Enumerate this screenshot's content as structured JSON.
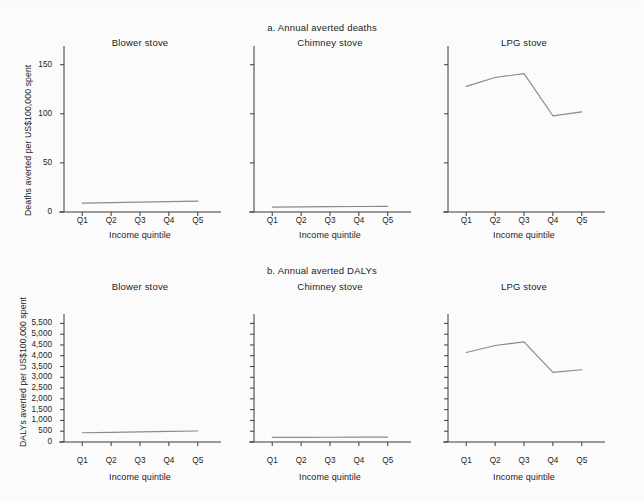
{
  "figure": {
    "background_color": "#fbfbfb",
    "line_color": "#8a8a8a",
    "axis_color": "#3a3a3a",
    "text_color": "#1c1c1c"
  },
  "sections": [
    {
      "key": "a",
      "title": "a. Annual averted deaths",
      "ylabel": "Deaths averted per US$100,000 spent",
      "xlabel": "Income quintile",
      "yticks": [
        "0",
        "50",
        "100",
        "150"
      ],
      "ytick_values": [
        0,
        50,
        100,
        150
      ],
      "ylim": [
        0,
        165
      ],
      "xticks": [
        "Q1",
        "Q2",
        "Q3",
        "Q4",
        "Q5"
      ],
      "panels": [
        {
          "title": "Blower stove",
          "values": [
            9,
            9.5,
            10,
            10.5,
            11
          ]
        },
        {
          "title": "Chimney stove",
          "values": [
            5,
            5.2,
            5.4,
            5.6,
            5.8
          ]
        },
        {
          "title": "LPG stove",
          "values": [
            128,
            137,
            141,
            98,
            102
          ]
        }
      ]
    },
    {
      "key": "b",
      "title": "b. Annual averted DALYs",
      "ylabel": "DALYs averted per US$100,000 spent",
      "xlabel": "Income quintile",
      "yticks": [
        "0",
        "500",
        "1,000",
        "1,500",
        "2,000",
        "2,500",
        "3,000",
        "3,500",
        "4,000",
        "4,500",
        "5,000",
        "5,500"
      ],
      "ytick_values": [
        0,
        500,
        1000,
        1500,
        2000,
        2500,
        3000,
        3500,
        4000,
        4500,
        5000,
        5500
      ],
      "ylim": [
        0,
        5750
      ],
      "xticks": [
        "Q1",
        "Q2",
        "Q3",
        "Q4",
        "Q5"
      ],
      "panels": [
        {
          "title": "Blower stove",
          "values": [
            430,
            450,
            470,
            490,
            510
          ]
        },
        {
          "title": "Chimney stove",
          "values": [
            210,
            215,
            220,
            225,
            230
          ]
        },
        {
          "title": "LPG stove",
          "values": [
            4150,
            4475,
            4640,
            3225,
            3350
          ]
        }
      ]
    }
  ],
  "chart_data": {
    "type": "line",
    "layout": "2 rows x 3 columns of small-multiple line panels; each panel shares the row y-axis scale; left and bottom spines only; no gridlines; no legend",
    "panels": [
      {
        "section": "a. Annual averted deaths",
        "panel": "Blower stove",
        "xlabel": "Income quintile",
        "ylabel": "Deaths averted per US$100,000 spent",
        "x": [
          "Q1",
          "Q2",
          "Q3",
          "Q4",
          "Q5"
        ],
        "y": [
          9,
          9.5,
          10,
          10.5,
          11
        ],
        "ylim": [
          0,
          165
        ],
        "yticks": [
          0,
          50,
          100,
          150
        ]
      },
      {
        "section": "a. Annual averted deaths",
        "panel": "Chimney stove",
        "xlabel": "Income quintile",
        "ylabel": "Deaths averted per US$100,000 spent",
        "x": [
          "Q1",
          "Q2",
          "Q3",
          "Q4",
          "Q5"
        ],
        "y": [
          5,
          5.2,
          5.4,
          5.6,
          5.8
        ],
        "ylim": [
          0,
          165
        ],
        "yticks": [
          0,
          50,
          100,
          150
        ]
      },
      {
        "section": "a. Annual averted deaths",
        "panel": "LPG stove",
        "xlabel": "Income quintile",
        "ylabel": "Deaths averted per US$100,000 spent",
        "x": [
          "Q1",
          "Q2",
          "Q3",
          "Q4",
          "Q5"
        ],
        "y": [
          128,
          137,
          141,
          98,
          102
        ],
        "ylim": [
          0,
          165
        ],
        "yticks": [
          0,
          50,
          100,
          150
        ]
      },
      {
        "section": "b. Annual averted DALYs",
        "panel": "Blower stove",
        "xlabel": "Income quintile",
        "ylabel": "DALYs averted per US$100,000 spent",
        "x": [
          "Q1",
          "Q2",
          "Q3",
          "Q4",
          "Q5"
        ],
        "y": [
          430,
          450,
          470,
          490,
          510
        ],
        "ylim": [
          0,
          5750
        ],
        "yticks": [
          0,
          500,
          1000,
          1500,
          2000,
          2500,
          3000,
          3500,
          4000,
          4500,
          5000,
          5500
        ]
      },
      {
        "section": "b. Annual averted DALYs",
        "panel": "Chimney stove",
        "xlabel": "Income quintile",
        "ylabel": "DALYs averted per US$100,000 spent",
        "x": [
          "Q1",
          "Q2",
          "Q3",
          "Q4",
          "Q5"
        ],
        "y": [
          210,
          215,
          220,
          225,
          230
        ],
        "ylim": [
          0,
          5750
        ],
        "yticks": [
          0,
          500,
          1000,
          1500,
          2000,
          2500,
          3000,
          3500,
          4000,
          4500,
          5000,
          5500
        ]
      },
      {
        "section": "b. Annual averted DALYs",
        "panel": "LPG stove",
        "xlabel": "Income quintile",
        "ylabel": "DALYs averted per US$100,000 spent",
        "x": [
          "Q1",
          "Q2",
          "Q3",
          "Q4",
          "Q5"
        ],
        "y": [
          4150,
          4475,
          4640,
          3225,
          3350
        ],
        "ylim": [
          0,
          5750
        ],
        "yticks": [
          0,
          500,
          1000,
          1500,
          2000,
          2500,
          3000,
          3500,
          4000,
          4500,
          5000,
          5500
        ]
      }
    ]
  }
}
